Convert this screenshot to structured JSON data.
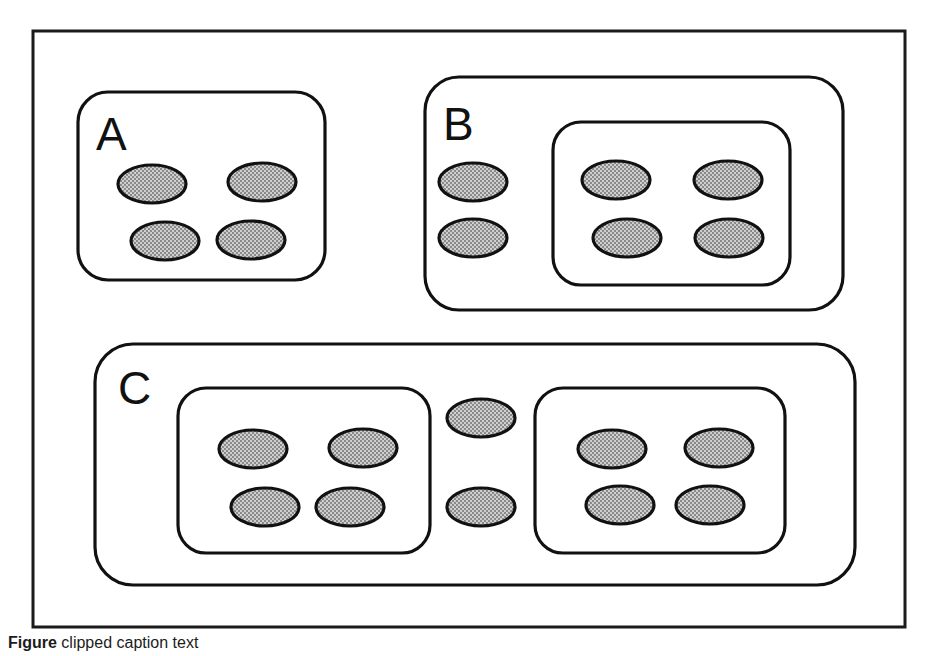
{
  "figure": {
    "frame": {
      "x": 33,
      "y": 31,
      "width": 872,
      "height": 596
    },
    "colors": {
      "ellipse_fill": "#a8a8a8",
      "stroke": "#111111",
      "frame_stroke": "#1a1a1a",
      "box_fill": "#ffffff",
      "background": "#ffffff"
    },
    "ellipse_size": {
      "rx": 34,
      "ry": 19
    }
  },
  "panels": [
    {
      "id": "panel-a",
      "label": "A",
      "label_pos": {
        "x": 96,
        "y": 150
      },
      "box": {
        "x": 78,
        "y": 92,
        "width": 247,
        "height": 188,
        "rx": 30
      },
      "sub_boxes": [],
      "ellipses": [
        {
          "cx": 152,
          "cy": 184
        },
        {
          "cx": 262,
          "cy": 182
        },
        {
          "cx": 165,
          "cy": 241
        },
        {
          "cx": 251,
          "cy": 240
        }
      ]
    },
    {
      "id": "panel-b",
      "label": "B",
      "label_pos": {
        "x": 443,
        "y": 140
      },
      "box": {
        "x": 425,
        "y": 77,
        "width": 418,
        "height": 233,
        "rx": 34
      },
      "sub_boxes": [
        {
          "id": "panel-b-inner",
          "x": 553,
          "y": 122,
          "width": 237,
          "height": 163,
          "rx": 28
        }
      ],
      "ellipses": [
        {
          "cx": 473,
          "cy": 182
        },
        {
          "cx": 473,
          "cy": 238
        },
        {
          "cx": 616,
          "cy": 180
        },
        {
          "cx": 728,
          "cy": 180
        },
        {
          "cx": 627,
          "cy": 238
        },
        {
          "cx": 729,
          "cy": 238
        }
      ]
    },
    {
      "id": "panel-c",
      "label": "C",
      "label_pos": {
        "x": 118,
        "y": 404
      },
      "box": {
        "x": 95,
        "y": 344,
        "width": 760,
        "height": 241,
        "rx": 38
      },
      "sub_boxes": [
        {
          "id": "panel-c-inner-left",
          "x": 178,
          "y": 388,
          "width": 252,
          "height": 165,
          "rx": 28
        },
        {
          "id": "panel-c-inner-right",
          "x": 535,
          "y": 388,
          "width": 250,
          "height": 165,
          "rx": 28
        }
      ],
      "ellipses": [
        {
          "cx": 253,
          "cy": 449
        },
        {
          "cx": 363,
          "cy": 448
        },
        {
          "cx": 265,
          "cy": 507
        },
        {
          "cx": 350,
          "cy": 507
        },
        {
          "cx": 481,
          "cy": 418
        },
        {
          "cx": 481,
          "cy": 507
        },
        {
          "cx": 612,
          "cy": 449
        },
        {
          "cx": 719,
          "cy": 448
        },
        {
          "cx": 620,
          "cy": 505
        },
        {
          "cx": 710,
          "cy": 505
        }
      ]
    }
  ],
  "caption": {
    "label": "Figure",
    "rest": "clipped caption text"
  }
}
